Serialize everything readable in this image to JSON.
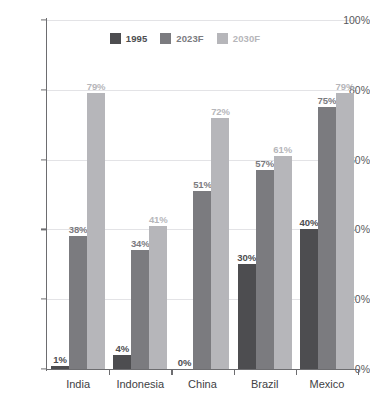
{
  "chart_data": {
    "type": "bar",
    "title": "",
    "xlabel": "",
    "ylabel": "",
    "ylim": [
      0,
      100
    ],
    "ytick_labels": [
      "100%",
      "80%",
      "60%",
      "40%",
      "20%",
      "0%"
    ],
    "ytick_values": [
      100,
      80,
      60,
      40,
      20,
      0
    ],
    "grid": true,
    "legend_position": "top-center",
    "categories": [
      "India",
      "Indonesia",
      "China",
      "Brazil",
      "Mexico"
    ],
    "series": [
      {
        "name": "1995",
        "color": "#4d4d50",
        "values": [
          1,
          4,
          0,
          30,
          40
        ],
        "labels": [
          "1%",
          "4%",
          "0%",
          "30%",
          "40%"
        ]
      },
      {
        "name": "2023F",
        "color": "#7b7b7f",
        "values": [
          38,
          34,
          51,
          57,
          75
        ],
        "labels": [
          "38%",
          "34%",
          "51%",
          "57%",
          "75%"
        ]
      },
      {
        "name": "2030F",
        "color": "#b6b6ba",
        "values": [
          79,
          41,
          72,
          61,
          79
        ],
        "labels": [
          "79%",
          "41%",
          "72%",
          "61%",
          "79%"
        ]
      }
    ]
  },
  "legend": {
    "items": [
      {
        "label": "1995",
        "color": "#4d4d50"
      },
      {
        "label": "2023F",
        "color": "#7b7b7f"
      },
      {
        "label": "2030F",
        "color": "#b6b6ba"
      }
    ]
  },
  "colors": {
    "series_1995": "#4d4d50",
    "series_2023F": "#7b7b7f",
    "series_2030F": "#b6b6ba",
    "axis": "#6d6d70",
    "gridline": "#e3e3e6",
    "tick_text": "#58585b",
    "category_text": "#414144",
    "background": "#ffffff"
  }
}
